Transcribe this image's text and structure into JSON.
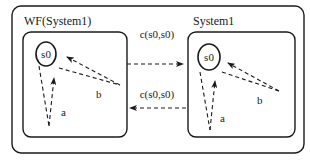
{
  "diagram": {
    "outer_box": {
      "label": ""
    },
    "left_system": {
      "title": "WF(System1)",
      "state": "s0",
      "self_loops": [
        {
          "label": "a"
        },
        {
          "label": "b"
        }
      ]
    },
    "right_system": {
      "title": "System1",
      "state": "s0",
      "self_loops": [
        {
          "label": "a"
        },
        {
          "label": "b"
        }
      ]
    },
    "channels": [
      {
        "label": "c(s0,s0)",
        "direction": "left-to-right"
      },
      {
        "label": "c(s0,s0)",
        "direction": "right-to-left"
      }
    ],
    "colors": {
      "stroke": "#1a1a1a",
      "background": "#ffffff"
    }
  }
}
